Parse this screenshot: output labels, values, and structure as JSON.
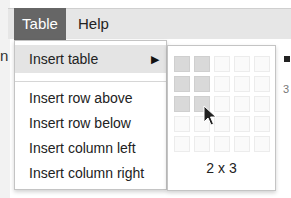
{
  "menubar": {
    "items": [
      {
        "label": "Table",
        "active": true
      },
      {
        "label": "Help",
        "active": false
      }
    ],
    "left_edge_text": "n",
    "right_edge_text": "3"
  },
  "dropdown": {
    "items": [
      {
        "label": "Insert table",
        "submenu_arrow": "▶",
        "highlighted": true
      },
      {
        "label": "Insert row above"
      },
      {
        "label": "Insert row below"
      },
      {
        "label": "Insert column left"
      },
      {
        "label": "Insert column right"
      }
    ]
  },
  "table_picker": {
    "grid_rows": 5,
    "grid_cols": 5,
    "selected_cols": 2,
    "selected_rows": 3,
    "size_label": "2 x 3",
    "selected_color": "#d9d9d9",
    "empty_color": "#fafafa"
  },
  "colors": {
    "menubar_bg": "#e6e6e6",
    "active_menu_bg": "#666666",
    "highlight_bg": "#e4e4e4"
  }
}
